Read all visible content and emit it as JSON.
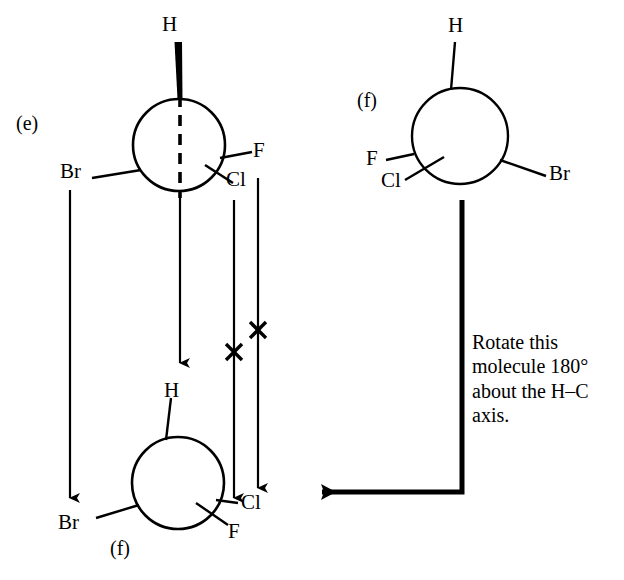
{
  "figure": {
    "background_color": "#ffffff",
    "stroke_color": "#000000",
    "parts": [
      {
        "id": "e",
        "label": "(e)",
        "type": "newman-projection",
        "description": "Newman projection with bold wedge H at top, dashed vertical rotation axis through circle, Br to lower-left, F to right, Cl to lower-right",
        "substituents": [
          "H",
          "Br",
          "F",
          "Cl"
        ]
      },
      {
        "id": "f-top",
        "label": "(f)",
        "type": "newman-projection",
        "description": "Newman projection with H at top, F to left, Cl to lower-left, Br to right",
        "substituents": [
          "H",
          "F",
          "Cl",
          "Br"
        ]
      },
      {
        "id": "f-bottom",
        "label": "(f)",
        "type": "newman-projection",
        "description": "Rotated Newman projection with H at top, Br to lower-left, Cl and F to lower-right",
        "substituents": [
          "H",
          "Br",
          "Cl",
          "F"
        ]
      }
    ],
    "instruction": "Rotate this molecule 180° about the H–C axis.",
    "instruction_lines": [
      "Rotate this",
      "molecule 180°",
      "about the H–C",
      "axis."
    ],
    "mapping_marks": [
      {
        "name": "x-mark-cl",
        "meaning": "crossed correspondence line"
      },
      {
        "name": "x-mark-f",
        "meaning": "crossed correspondence line"
      }
    ],
    "labels": {
      "part_e": "(e)",
      "part_f_top": "(f)",
      "part_f_bottom": "(f)",
      "e_h": "H",
      "e_br": "Br",
      "e_f": "F",
      "e_cl": "Cl",
      "ftop_h": "H",
      "ftop_f": "F",
      "ftop_cl": "Cl",
      "ftop_br": "Br",
      "fbot_h": "H",
      "fbot_br": "Br",
      "fbot_cl": "Cl",
      "fbot_f": "F"
    }
  }
}
